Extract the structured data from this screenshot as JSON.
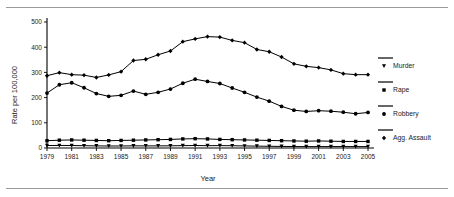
{
  "figure": {
    "top_rule": true,
    "bottom_rule": true
  },
  "chart_data": {
    "type": "line",
    "title": "",
    "xlabel": "Year",
    "ylabel": "Rate per 100,000",
    "xlim": [
      1979,
      2005
    ],
    "ylim": [
      0,
      500
    ],
    "grid": false,
    "legend_position": "right",
    "y_ticks": [
      0,
      100,
      200,
      300,
      400,
      500
    ],
    "y_tick_labels": [
      "0",
      "100",
      "200",
      "300",
      "400",
      "500"
    ],
    "x_ticks": [
      1979,
      1981,
      1983,
      1985,
      1987,
      1989,
      1991,
      1993,
      1995,
      1997,
      1999,
      2001,
      2003,
      2005
    ],
    "x_tick_labels": [
      "1979",
      "1981",
      "1983",
      "1985",
      "1987",
      "1989",
      "1991",
      "1993",
      "1995",
      "1997",
      "1999",
      "2001",
      "2003",
      "2005"
    ],
    "x": [
      1979,
      1980,
      1981,
      1982,
      1983,
      1984,
      1985,
      1986,
      1987,
      1988,
      1989,
      1990,
      1991,
      1992,
      1993,
      1994,
      1995,
      1996,
      1997,
      1998,
      1999,
      2000,
      2001,
      2002,
      2003,
      2004,
      2005
    ],
    "series": [
      {
        "name": "Murder",
        "marker": "triangle-down",
        "values": [
          9.8,
          10.2,
          9.8,
          9.1,
          8.3,
          7.9,
          8.0,
          8.6,
          8.3,
          8.4,
          8.7,
          9.4,
          9.8,
          9.3,
          9.5,
          9.0,
          8.2,
          7.4,
          6.8,
          6.3,
          5.7,
          5.5,
          5.6,
          5.6,
          5.7,
          5.5,
          5.6
        ]
      },
      {
        "name": "Rape",
        "marker": "square",
        "values": [
          29,
          31,
          32,
          31,
          30,
          29,
          30,
          31,
          32,
          33,
          34,
          36,
          37,
          36,
          34,
          33,
          32,
          31,
          30,
          29,
          28,
          27,
          28,
          27,
          26,
          26,
          26
        ]
      },
      {
        "name": "Robbery",
        "marker": "circle",
        "values": [
          218,
          251,
          259,
          239,
          216,
          205,
          209,
          226,
          213,
          221,
          234,
          257,
          273,
          264,
          256,
          238,
          221,
          202,
          186,
          165,
          150,
          145,
          148,
          146,
          142,
          136,
          141
        ]
      },
      {
        "name": "Agg. Assault",
        "marker": "diamond",
        "values": [
          287,
          299,
          291,
          289,
          280,
          290,
          303,
          347,
          352,
          370,
          385,
          422,
          433,
          442,
          440,
          427,
          418,
          391,
          382,
          361,
          334,
          324,
          319,
          310,
          295,
          291,
          291
        ]
      }
    ]
  },
  "legend": {
    "entries": [
      {
        "label": "Murder"
      },
      {
        "label": "Rape"
      },
      {
        "label": "Robbery"
      },
      {
        "label": "Agg. Assault"
      }
    ]
  }
}
